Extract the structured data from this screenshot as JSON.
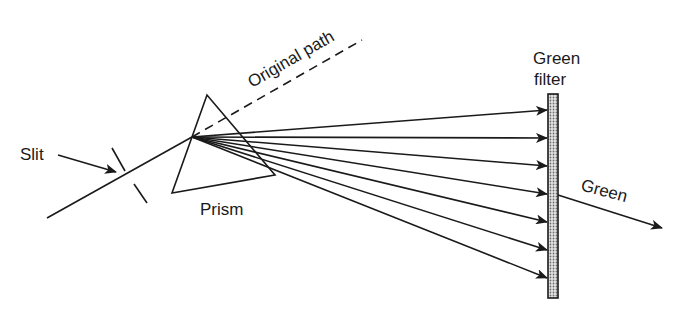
{
  "diagram": {
    "type": "optics-prism-dispersion",
    "labels": {
      "slit": "Slit",
      "prism": "Prism",
      "original_path": "Original path",
      "filter_line1": "Green",
      "filter_line2": "filter",
      "output": "Green"
    },
    "colors": {
      "stroke": "#1a1a1a",
      "filter_fill": "#bdbdbd",
      "background": "#ffffff"
    },
    "ray_count": 7,
    "ray_origin": [
      192,
      137
    ],
    "ray_targets_y": [
      110,
      138,
      166,
      194,
      222,
      250,
      278
    ],
    "filter_x": 548
  }
}
